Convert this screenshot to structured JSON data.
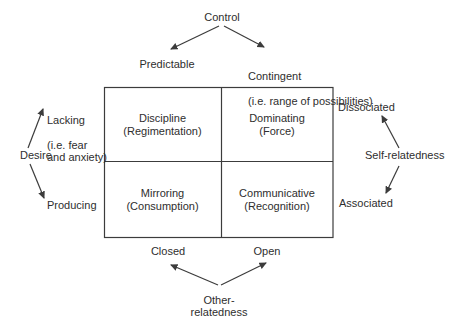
{
  "axes": {
    "control": {
      "label": "Control",
      "left": "Predictable",
      "right": "Contingent",
      "right_note": "(i.e. range of possibilities)"
    },
    "desire": {
      "label": "Desire",
      "up": "Lacking",
      "up_note": "(i.e. fear\nand anxiety)",
      "down": "Producing"
    },
    "self_relatedness": {
      "label": "Self-relatedness",
      "up": "Dissociated",
      "down": "Associated"
    },
    "other_relatedness": {
      "label": "Other-\nrelatedness",
      "left": "Closed",
      "right": "Open"
    }
  },
  "matrix": {
    "cells": [
      {
        "title": "Discipline",
        "subtitle": "(Regimentation)"
      },
      {
        "title": "Dominating",
        "subtitle": "(Force)"
      },
      {
        "title": "Mirroring",
        "subtitle": "(Consumption)"
      },
      {
        "title": "Communicative",
        "subtitle": "(Recognition)"
      }
    ]
  },
  "colors": {
    "background": "#ffffff",
    "text": "#2e2e2e",
    "line": "#3c3c3c"
  }
}
